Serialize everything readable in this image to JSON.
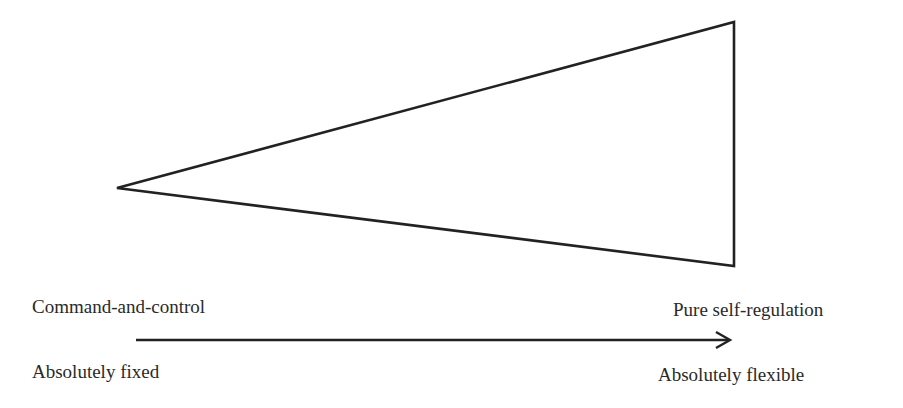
{
  "diagram": {
    "shape": "triangle",
    "triangle": {
      "points": [
        [
          117,
          188
        ],
        [
          734,
          22
        ],
        [
          734,
          266
        ]
      ],
      "stroke": "#222222"
    },
    "arrow": {
      "from": [
        136,
        340
      ],
      "to": [
        730,
        340
      ],
      "stroke": "#222222"
    },
    "labels": {
      "left_top": "Command-and-control",
      "left_bottom": "Absolutely fixed",
      "right_top": "Pure self-regulation",
      "right_bottom": "Absolutely flexible"
    }
  }
}
